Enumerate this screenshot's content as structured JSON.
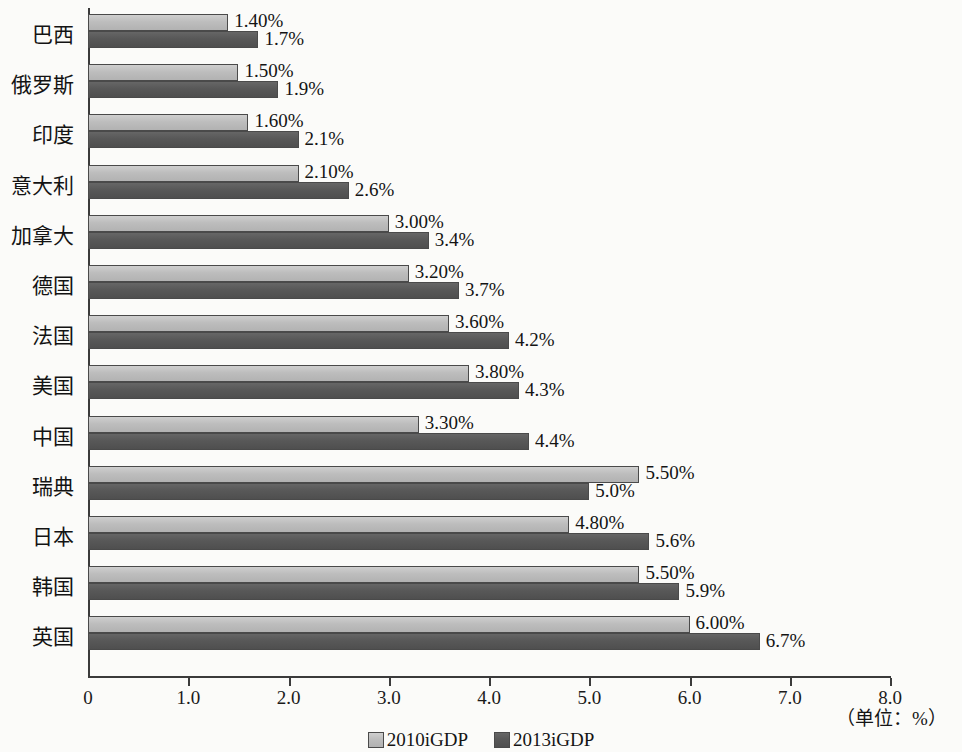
{
  "chart_data": {
    "type": "bar",
    "orientation": "horizontal",
    "title": "",
    "xlabel": "（单位：%）",
    "ylabel": "",
    "xlim": [
      0,
      8.0
    ],
    "grid": false,
    "legend_position": "bottom-center",
    "categories": [
      "巴西",
      "俄罗斯",
      "印度",
      "意大利",
      "加拿大",
      "德国",
      "法国",
      "美国",
      "中国",
      "瑞典",
      "日本",
      "韩国",
      "英国"
    ],
    "series": [
      {
        "name": "2010iGDP",
        "color": "#bdbdbd",
        "values": [
          1.4,
          1.5,
          1.6,
          2.1,
          3.0,
          3.2,
          3.6,
          3.8,
          3.3,
          5.5,
          4.8,
          5.5,
          6.0
        ],
        "labels": [
          "1.40%",
          "1.50%",
          "1.60%",
          "2.10%",
          "3.00%",
          "3.20%",
          "3.60%",
          "3.80%",
          "3.30%",
          "5.50%",
          "4.80%",
          "5.50%",
          "6.00%"
        ]
      },
      {
        "name": "2013iGDP",
        "color": "#585858",
        "values": [
          1.7,
          1.9,
          2.1,
          2.6,
          3.4,
          3.7,
          4.2,
          4.3,
          4.4,
          5.0,
          5.6,
          5.9,
          6.7
        ],
        "labels": [
          "1.7%",
          "1.9%",
          "2.1%",
          "2.6%",
          "3.4%",
          "3.7%",
          "4.2%",
          "4.3%",
          "4.4%",
          "5.0%",
          "5.6%",
          "5.9%",
          "6.7%"
        ]
      }
    ],
    "xticks": [
      0,
      1.0,
      2.0,
      3.0,
      4.0,
      5.0,
      6.0,
      7.0,
      8.0
    ],
    "xtick_labels": [
      "0",
      "1.0",
      "2.0",
      "3.0",
      "4.0",
      "5.0",
      "6.0",
      "7.0",
      "8.0"
    ]
  },
  "axis": {
    "unit_note": "（单位：%）"
  },
  "legend": {
    "items": [
      {
        "label": "2010iGDP",
        "swatch": "light-gray-swatch"
      },
      {
        "label": "2013iGDP",
        "swatch": "dark-gray-swatch"
      }
    ]
  }
}
